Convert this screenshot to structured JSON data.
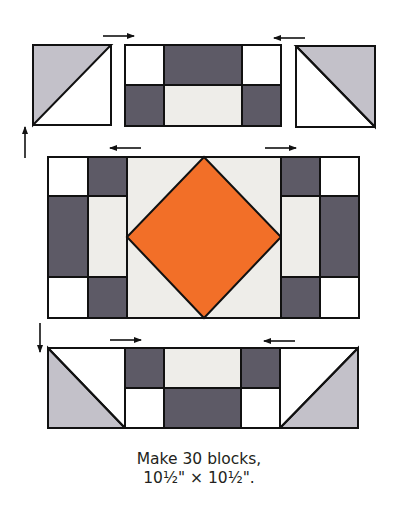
{
  "colors": {
    "dark_gray": "#5d5a66",
    "light_gray_triangle": "#c3c1c9",
    "off_white": "#eeede9",
    "white": "#ffffff",
    "orange": "#f26f28",
    "outline": "#111111"
  },
  "diagram": {
    "rows": [
      {
        "name": "top-row",
        "units": [
          "half-square-triangle",
          "four-patch-rectangle",
          "half-square-triangle"
        ],
        "press_arrows": [
          "right",
          "left"
        ]
      },
      {
        "name": "center-row",
        "units": [
          "side-unit",
          "square-in-a-square",
          "side-unit"
        ],
        "press_arrows": [
          "left",
          "right"
        ]
      },
      {
        "name": "bottom-row",
        "units": [
          "half-square-triangle",
          "four-patch-rectangle",
          "half-square-triangle"
        ],
        "press_arrows": [
          "right",
          "left"
        ]
      }
    ],
    "row_seam_arrows": [
      "up",
      "down"
    ]
  },
  "caption": {
    "line1": "Make 30 blocks,",
    "line2": "10½\" × 10½\"."
  }
}
